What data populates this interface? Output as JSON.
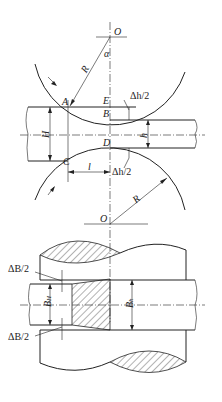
{
  "diagram": {
    "top_view": {
      "labels": {
        "O_top": "O",
        "alpha": "α",
        "R_top": "R",
        "A": "A",
        "E": "E",
        "B": "B",
        "C": "C",
        "D": "D",
        "dh2_top": "Δh/2",
        "dh2_bottom": "Δh/2",
        "H": "H",
        "h": "h",
        "l": "l",
        "O_bottom": "O",
        "R_bottom": "R"
      }
    },
    "bottom_view": {
      "labels": {
        "dB2_top": "ΔB/2",
        "dB2_bottom": "ΔB/2",
        "BH": "B",
        "BH_sub": "H",
        "Bh": "B",
        "Bh_sub": "h"
      }
    },
    "colors": {
      "line": "#222222",
      "background": "#ffffff"
    }
  }
}
